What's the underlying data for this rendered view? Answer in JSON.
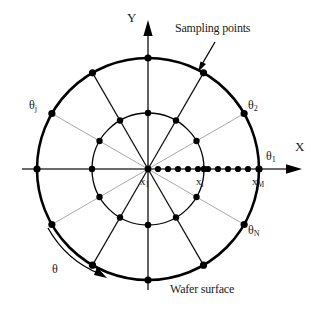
{
  "figure": {
    "type": "polar-sampling-diagram",
    "title_caption": "Wafer surface",
    "annotation": "Sampling points",
    "background": "#ffffff",
    "stroke_color": "#000000",
    "point_color": "#000000"
  },
  "axes": {
    "x_label": "X",
    "y_label": "Y",
    "origin_label_x": "x",
    "origin_label_sub": "1",
    "mid_label_x": "x",
    "mid_label_sub": "i",
    "end_label_x": "x",
    "end_label_sub": "M"
  },
  "angles": {
    "theta1": "θ",
    "theta1_sub": "1",
    "theta2": "θ",
    "theta2_sub": "2",
    "thetaj": "θ",
    "thetaj_sub": "j",
    "thetaN": "θ",
    "thetaN_sub": "N",
    "rotation": "θ"
  },
  "chart_data": {
    "type": "scatter",
    "title": "Wafer surface",
    "xlabel": "X",
    "ylabel": "Y",
    "coordinate_system": "polar",
    "center": [
      148,
      169
    ],
    "outer_radius": 111,
    "inner_radius": 56,
    "num_spokes": 12,
    "spoke_angles_deg": [
      0,
      30,
      60,
      90,
      120,
      150,
      180,
      210,
      240,
      270,
      300,
      330
    ],
    "radial_samples_per_spoke": 12,
    "x_axis_sample_radii": [
      0,
      10,
      20,
      30,
      40,
      50,
      60,
      70,
      80,
      90,
      100,
      111
    ],
    "labeled_points": [
      {
        "label": "x1",
        "radius": 0,
        "angle_deg": 0
      },
      {
        "label": "xi",
        "radius": 56,
        "angle_deg": 0
      },
      {
        "label": "xM",
        "radius": 111,
        "angle_deg": 0
      }
    ],
    "labeled_angles": [
      {
        "label": "theta1",
        "angle_deg": 0
      },
      {
        "label": "theta2",
        "angle_deg": 30
      },
      {
        "label": "thetaj",
        "angle_deg": 150
      },
      {
        "label": "thetaN",
        "angle_deg": -30
      }
    ],
    "grid": false,
    "legend": null
  }
}
